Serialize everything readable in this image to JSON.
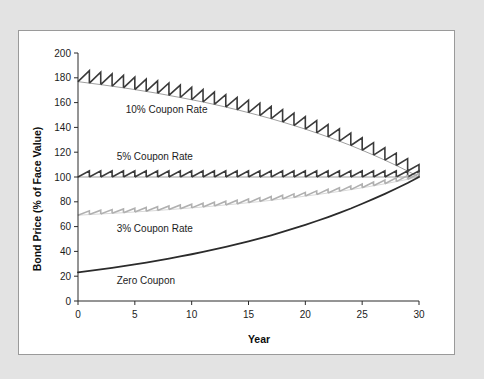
{
  "figure": {
    "background_color": "#e3e3e3",
    "card_color": "#ffffff",
    "border_color": "#9a9a9a"
  },
  "chart_data": {
    "type": "line",
    "title": "",
    "subtitle": "",
    "xlabel": "Year",
    "ylabel": "Bond Price (% of Face Value)",
    "xlim": [
      0,
      30
    ],
    "ylim": [
      0,
      200
    ],
    "xticks": [
      0,
      5,
      10,
      15,
      20,
      25,
      30
    ],
    "yticks": [
      0,
      20,
      40,
      60,
      80,
      100,
      120,
      140,
      160,
      180,
      200
    ],
    "xtick_labels": [
      "0",
      "5",
      "10",
      "15",
      "20",
      "25",
      "30"
    ],
    "ytick_labels": [
      "0",
      "20",
      "40",
      "60",
      "80",
      "100",
      "120",
      "140",
      "160",
      "180",
      "200"
    ],
    "grid": false,
    "legend_position": "inline-annotations",
    "market_yield_pct": 5,
    "maturity_years": 30,
    "par_value_pct": 100,
    "series": [
      {
        "name": "10% Coupon Rate",
        "label": "10% Coupon Rate",
        "coupon_rate_pct": 10,
        "color": "#3b3b3b",
        "line_width": 1.6,
        "sawtooth": true,
        "label_x": 4.2,
        "label_y": 152,
        "values": [
          176.9,
          175.7,
          174.5,
          173.2,
          171.9,
          170.5,
          169.0,
          167.5,
          165.8,
          164.1,
          162.3,
          160.5,
          158.5,
          156.4,
          154.2,
          151.9,
          149.5,
          147.0,
          144.3,
          141.5,
          138.6,
          135.5,
          132.3,
          128.9,
          125.4,
          121.6,
          117.7,
          113.6,
          109.3,
          104.8,
          100.0
        ]
      },
      {
        "name": "5% Coupon Rate",
        "label": "5% Coupon Rate",
        "coupon_rate_pct": 5,
        "color": "#3b3b3b",
        "line_width": 1.6,
        "sawtooth": true,
        "label_x": 3.4,
        "label_y": 114,
        "values": [
          100,
          100,
          100,
          100,
          100,
          100,
          100,
          100,
          100,
          100,
          100,
          100,
          100,
          100,
          100,
          100,
          100,
          100,
          100,
          100,
          100,
          100,
          100,
          100,
          100,
          100,
          100,
          100,
          100,
          100,
          100
        ]
      },
      {
        "name": "3% Coupon Rate",
        "label": "3% Coupon Rate",
        "coupon_rate_pct": 3,
        "color": "#b0b0b0",
        "line_width": 1.6,
        "sawtooth": true,
        "label_x": 3.4,
        "label_y": 56,
        "values": [
          69.2,
          69.7,
          70.2,
          70.7,
          71.2,
          71.8,
          72.4,
          73.0,
          73.7,
          74.4,
          75.1,
          75.8,
          76.6,
          77.5,
          78.3,
          79.3,
          80.2,
          81.2,
          82.3,
          83.4,
          84.6,
          85.8,
          87.1,
          88.4,
          89.8,
          91.3,
          92.9,
          94.5,
          96.3,
          98.1,
          100.0
        ]
      },
      {
        "name": "Zero Coupon",
        "label": "Zero Coupon",
        "coupon_rate_pct": 0,
        "color": "#2b2b2b",
        "line_width": 1.8,
        "sawtooth": false,
        "label_x": 3.4,
        "label_y": 14,
        "values": [
          23.1,
          24.3,
          25.5,
          26.8,
          28.1,
          29.5,
          31.0,
          32.6,
          34.2,
          35.9,
          37.7,
          39.6,
          41.6,
          43.6,
          45.8,
          48.1,
          50.5,
          53.0,
          55.7,
          58.5,
          61.4,
          64.5,
          67.7,
          71.1,
          74.6,
          78.4,
          82.3,
          86.4,
          90.7,
          95.2,
          100.0
        ]
      }
    ]
  }
}
